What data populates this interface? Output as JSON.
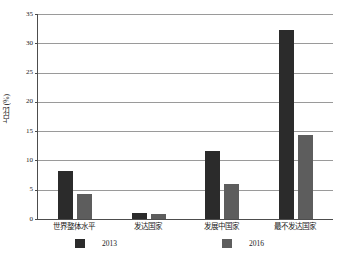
{
  "chart_data": {
    "type": "bar",
    "title": "",
    "xlabel": "",
    "ylabel": "占比 (%)",
    "ylim": [
      0,
      35
    ],
    "yticks": [
      "0",
      "5",
      "10",
      "15",
      "20",
      "25",
      "30",
      "35"
    ],
    "grid": true,
    "legend_position": "bottom",
    "categories": [
      "世界整体水平",
      "发达国家",
      "发展中国家",
      "最不发达国家"
    ],
    "series": [
      {
        "name": "2013",
        "color": "#2b2b2b",
        "values": [
          8.2,
          1.0,
          11.6,
          32.3
        ]
      },
      {
        "name": "2016",
        "color": "#5d5d5d",
        "values": [
          4.3,
          0.8,
          6.0,
          14.3
        ]
      }
    ]
  }
}
